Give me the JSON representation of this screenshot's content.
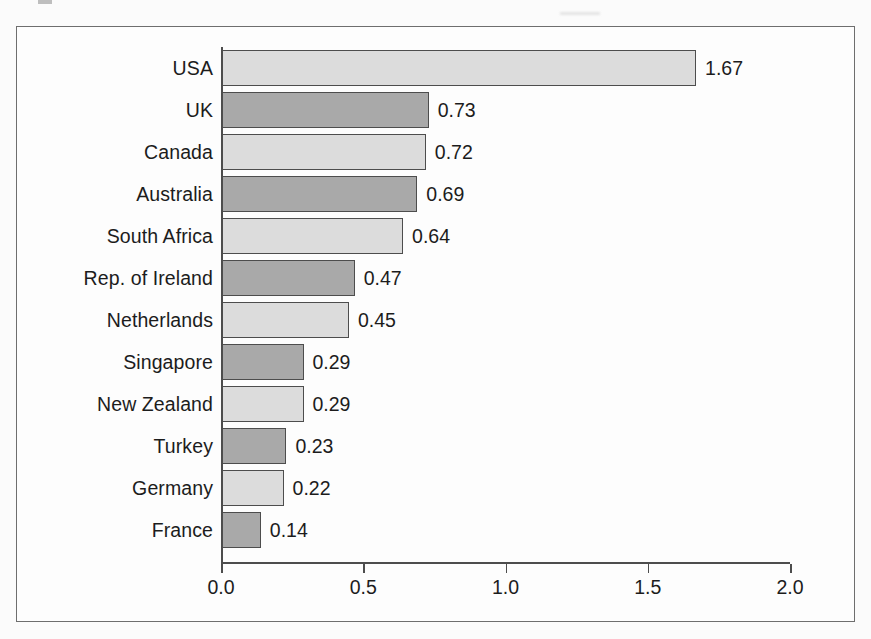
{
  "figure": {
    "frame_visible": true,
    "background_color": "#fdfdfd",
    "border_color": "#6e6e6e"
  },
  "chart_data": {
    "type": "bar",
    "orientation": "horizontal",
    "title": "",
    "subtitle": "",
    "xlabel": "",
    "ylabel": "",
    "xlim": [
      0.0,
      2.0
    ],
    "ylim": null,
    "grid": false,
    "legend": null,
    "legend_position": "none",
    "xtick_labels": [
      "0.0",
      "0.5",
      "1.0",
      "1.5",
      "2.0"
    ],
    "xtick_values": [
      0.0,
      0.5,
      1.0,
      1.5,
      2.0
    ],
    "value_label_format": "0.00",
    "bar_colors": [
      "#dcdcdc",
      "#a9a9a9"
    ],
    "bar_edge_color": "#4d4d4d",
    "categories": [
      "USA",
      "UK",
      "Canada",
      "Australia",
      "South Africa",
      "Rep. of Ireland",
      "Netherlands",
      "Singapore",
      "New Zealand",
      "Turkey",
      "Germany",
      "France"
    ],
    "values": [
      1.67,
      0.73,
      0.72,
      0.69,
      0.64,
      0.47,
      0.45,
      0.29,
      0.29,
      0.23,
      0.22,
      0.14
    ],
    "value_labels": [
      "1.67",
      "0.73",
      "0.72",
      "0.69",
      "0.64",
      "0.47",
      "0.45",
      "0.29",
      "0.29",
      "0.23",
      "0.22",
      "0.14"
    ],
    "bars": [
      {
        "category": "USA",
        "value": 1.67,
        "label": "1.67",
        "shade": "light"
      },
      {
        "category": "UK",
        "value": 0.73,
        "label": "0.73",
        "shade": "dark"
      },
      {
        "category": "Canada",
        "value": 0.72,
        "label": "0.72",
        "shade": "light"
      },
      {
        "category": "Australia",
        "value": 0.69,
        "label": "0.69",
        "shade": "dark"
      },
      {
        "category": "South Africa",
        "value": 0.64,
        "label": "0.64",
        "shade": "light"
      },
      {
        "category": "Rep. of Ireland",
        "value": 0.47,
        "label": "0.47",
        "shade": "dark"
      },
      {
        "category": "Netherlands",
        "value": 0.45,
        "label": "0.45",
        "shade": "light"
      },
      {
        "category": "Singapore",
        "value": 0.29,
        "label": "0.29",
        "shade": "dark"
      },
      {
        "category": "New Zealand",
        "value": 0.29,
        "label": "0.29",
        "shade": "light"
      },
      {
        "category": "Turkey",
        "value": 0.23,
        "label": "0.23",
        "shade": "dark"
      },
      {
        "category": "Germany",
        "value": 0.22,
        "label": "0.22",
        "shade": "light"
      },
      {
        "category": "France",
        "value": 0.14,
        "label": "0.14",
        "shade": "dark"
      }
    ]
  },
  "geometry": {
    "origin_x": 221,
    "axis_y": 562,
    "px_per_unit": 284.5,
    "first_row_top": 47,
    "row_pitch": 42,
    "bar_height": 36,
    "label_column_right": 213,
    "value_gap": 9
  }
}
